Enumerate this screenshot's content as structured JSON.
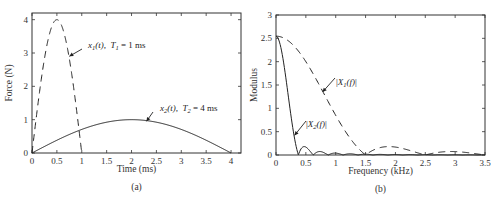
{
  "chart_data": [
    {
      "type": "line",
      "panel_label": "(a)",
      "title": "",
      "xlabel": "Time (ms)",
      "ylabel": "Force (N)",
      "xlim": [
        0,
        4.2
      ],
      "ylim": [
        0,
        4.2
      ],
      "xticks": [
        0,
        0.5,
        1,
        1.5,
        2,
        2.5,
        3,
        3.5,
        4
      ],
      "xtick_labels": [
        "0",
        "0.5",
        "1",
        "1.5",
        "2",
        "2.5",
        "3",
        "3.5",
        "4"
      ],
      "yticks": [
        0,
        1,
        2,
        3,
        4
      ],
      "ytick_labels": [
        "0",
        "1",
        "2",
        "3",
        "4"
      ],
      "grid": false,
      "series": [
        {
          "name": "x1(t), T1 = 1 ms",
          "style": "dashed",
          "function": "half-sine pulse, amplitude 4 N, duration 1 ms",
          "x": [
            0,
            0.1,
            0.2,
            0.3,
            0.4,
            0.5,
            0.6,
            0.7,
            0.8,
            0.9,
            1.0
          ],
          "y": [
            0,
            1.24,
            2.35,
            3.24,
            3.8,
            4.0,
            3.8,
            3.24,
            2.35,
            1.24,
            0
          ]
        },
        {
          "name": "x2(t), T2 = 4 ms",
          "style": "solid",
          "function": "half-sine pulse, amplitude 1 N, duration 4 ms",
          "x": [
            0,
            0.4,
            0.8,
            1.2,
            1.6,
            2.0,
            2.4,
            2.8,
            3.2,
            3.6,
            4.0
          ],
          "y": [
            0,
            0.31,
            0.59,
            0.81,
            0.95,
            1.0,
            0.95,
            0.81,
            0.59,
            0.31,
            0
          ]
        }
      ],
      "annotations": [
        {
          "series": 0,
          "text_main": "x",
          "text_sub": "1",
          "text_rest": "(t),",
          "param": "T",
          "param_sub": "1",
          "param_rest": " = 1 ms",
          "arrow_to": [
            0.75,
            2.9
          ]
        },
        {
          "series": 1,
          "text_main": "x",
          "text_sub": "2",
          "text_rest": "(t),",
          "param": "T",
          "param_sub": "2",
          "param_rest": " = 4 ms",
          "arrow_to": [
            2.3,
            0.95
          ]
        }
      ]
    },
    {
      "type": "line",
      "panel_label": "(b)",
      "title": "",
      "xlabel": "Frequency (kHz)",
      "ylabel": "Modulus",
      "xlim": [
        0,
        3.5
      ],
      "ylim": [
        0,
        3
      ],
      "xticks": [
        0,
        0.5,
        1,
        1.5,
        2,
        2.5,
        3,
        3.5
      ],
      "xtick_labels": [
        "0",
        "0.5",
        "1",
        "1.5",
        "2",
        "2.5",
        "3",
        "3.5"
      ],
      "yticks": [
        0,
        0.5,
        1,
        1.5,
        2,
        2.5,
        3
      ],
      "ytick_labels": [
        "0",
        "0.5",
        "1",
        "1.5",
        "2",
        "2.5",
        "3"
      ],
      "grid": false,
      "series": [
        {
          "name": "|X1(f)|",
          "style": "dashed",
          "function": "spectrum of 1 ms half-sine (A=4): |X(f)| = 2AT/pi * |cos(pi f T)| / |1-4f^2T^2|",
          "x": [
            0,
            0.25,
            0.5,
            0.75,
            1.0,
            1.25,
            1.5,
            1.75,
            2.0,
            2.25,
            2.5,
            2.75,
            3.0,
            3.25,
            3.5
          ],
          "y": [
            2.55,
            2.4,
            2.0,
            1.47,
            0.85,
            0.33,
            0.0,
            0.15,
            0.17,
            0.11,
            0.0,
            0.05,
            0.07,
            0.05,
            0.0
          ]
        },
        {
          "name": "|X2(f)|",
          "style": "solid",
          "function": "spectrum of 4 ms half-sine (A=1): |X(f)| = 2AT/pi * |cos(pi f T)| / |1-4f^2T^2|",
          "x": [
            0,
            0.1,
            0.2,
            0.3,
            0.375,
            0.45,
            0.5,
            0.625,
            0.7,
            0.875,
            0.95,
            1.125,
            1.2,
            1.5,
            2.0,
            3.5
          ],
          "y": [
            2.55,
            2.2,
            1.35,
            0.45,
            0.0,
            0.17,
            0.15,
            0.0,
            0.06,
            0.0,
            0.03,
            0.0,
            0.02,
            0.01,
            0.005,
            0.0
          ]
        }
      ],
      "annotations": [
        {
          "series": 0,
          "text_main": "X",
          "text_sub": "1",
          "text_rest": "(f)",
          "arrow_to": [
            0.78,
            1.35
          ]
        },
        {
          "series": 1,
          "text_main": "X",
          "text_sub": "2",
          "text_rest": "(f)",
          "arrow_to": [
            0.31,
            0.42
          ]
        }
      ]
    }
  ]
}
